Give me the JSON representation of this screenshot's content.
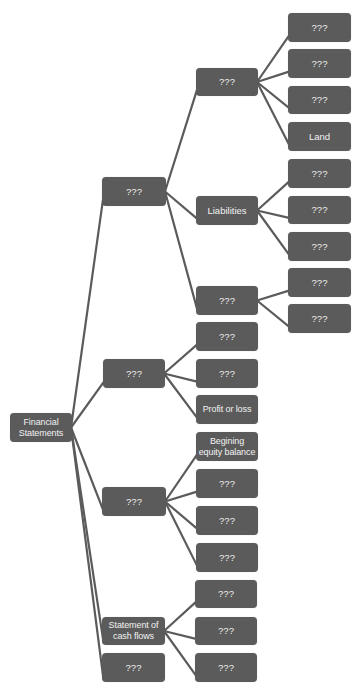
{
  "diagram": {
    "title": "Financial Statements",
    "colors": {
      "node_fill": "#5b5b5b",
      "node_text": "#f2f2f2",
      "edge": "#5b5b5b",
      "background": "#ffffff"
    },
    "nodes": [
      {
        "id": "root",
        "label": "Financial\nStatements",
        "x": 10,
        "y": 413,
        "w": 62,
        "h": 29
      },
      {
        "id": "l1a",
        "label": "???",
        "x": 102,
        "y": 177,
        "w": 64,
        "h": 29
      },
      {
        "id": "l1b",
        "label": "???",
        "x": 103,
        "y": 359,
        "w": 62,
        "h": 29
      },
      {
        "id": "l1c",
        "label": "???",
        "x": 102,
        "y": 487,
        "w": 64,
        "h": 29
      },
      {
        "id": "l1d",
        "label": "Statement of\ncash flows",
        "x": 102,
        "y": 617,
        "w": 63,
        "h": 28
      },
      {
        "id": "l1e",
        "label": "???",
        "x": 102,
        "y": 653,
        "w": 63,
        "h": 29
      },
      {
        "id": "l2a",
        "label": "???",
        "x": 196,
        "y": 68,
        "w": 62,
        "h": 28
      },
      {
        "id": "l2b",
        "label": "Liabilities",
        "x": 196,
        "y": 196,
        "w": 62,
        "h": 29
      },
      {
        "id": "l2c",
        "label": "???",
        "x": 196,
        "y": 286,
        "w": 62,
        "h": 29
      },
      {
        "id": "l2d",
        "label": "???",
        "x": 196,
        "y": 322,
        "w": 62,
        "h": 29
      },
      {
        "id": "l2e",
        "label": "???",
        "x": 196,
        "y": 359,
        "w": 62,
        "h": 29
      },
      {
        "id": "l2f",
        "label": "Profit or loss",
        "x": 196,
        "y": 395,
        "w": 62,
        "h": 29
      },
      {
        "id": "l2g",
        "label": "Begining\nequity balance",
        "x": 196,
        "y": 432,
        "w": 62,
        "h": 29
      },
      {
        "id": "l2h",
        "label": "???",
        "x": 196,
        "y": 469,
        "w": 62,
        "h": 29
      },
      {
        "id": "l2i",
        "label": "???",
        "x": 196,
        "y": 506,
        "w": 62,
        "h": 29
      },
      {
        "id": "l2j",
        "label": "???",
        "x": 196,
        "y": 543,
        "w": 62,
        "h": 29
      },
      {
        "id": "l2k",
        "label": "???",
        "x": 195,
        "y": 580,
        "w": 62,
        "h": 28
      },
      {
        "id": "l2l",
        "label": "???",
        "x": 195,
        "y": 617,
        "w": 62,
        "h": 28
      },
      {
        "id": "l2m",
        "label": "???",
        "x": 195,
        "y": 653,
        "w": 62,
        "h": 29
      },
      {
        "id": "l3a",
        "label": "???",
        "x": 288,
        "y": 13,
        "w": 63,
        "h": 29
      },
      {
        "id": "l3b",
        "label": "???",
        "x": 288,
        "y": 49,
        "w": 63,
        "h": 29
      },
      {
        "id": "l3c",
        "label": "???",
        "x": 288,
        "y": 86,
        "w": 63,
        "h": 28
      },
      {
        "id": "l3d",
        "label": "Land",
        "x": 288,
        "y": 122,
        "w": 63,
        "h": 29
      },
      {
        "id": "l3e",
        "label": "???",
        "x": 288,
        "y": 159,
        "w": 63,
        "h": 29
      },
      {
        "id": "l3f",
        "label": "???",
        "x": 288,
        "y": 196,
        "w": 63,
        "h": 28
      },
      {
        "id": "l3g",
        "label": "???",
        "x": 288,
        "y": 232,
        "w": 63,
        "h": 29
      },
      {
        "id": "l3h",
        "label": "???",
        "x": 288,
        "y": 268,
        "w": 63,
        "h": 29
      },
      {
        "id": "l3i",
        "label": "???",
        "x": 288,
        "y": 304,
        "w": 63,
        "h": 29
      }
    ],
    "edges": [
      [
        "root",
        "l1a"
      ],
      [
        "root",
        "l1b"
      ],
      [
        "root",
        "l1c"
      ],
      [
        "root",
        "l1d"
      ],
      [
        "root",
        "l1e"
      ],
      [
        "l1a",
        "l2a"
      ],
      [
        "l1a",
        "l2b"
      ],
      [
        "l1a",
        "l2c"
      ],
      [
        "l1b",
        "l2d"
      ],
      [
        "l1b",
        "l2e"
      ],
      [
        "l1b",
        "l2f"
      ],
      [
        "l1c",
        "l2g"
      ],
      [
        "l1c",
        "l2h"
      ],
      [
        "l1c",
        "l2i"
      ],
      [
        "l1c",
        "l2j"
      ],
      [
        "l1d",
        "l2k"
      ],
      [
        "l1d",
        "l2l"
      ],
      [
        "l1d",
        "l2m"
      ],
      [
        "l2a",
        "l3a"
      ],
      [
        "l2a",
        "l3b"
      ],
      [
        "l2a",
        "l3c"
      ],
      [
        "l2a",
        "l3d"
      ],
      [
        "l2b",
        "l3e"
      ],
      [
        "l2b",
        "l3f"
      ],
      [
        "l2b",
        "l3g"
      ],
      [
        "l2c",
        "l3h"
      ],
      [
        "l2c",
        "l3i"
      ]
    ]
  }
}
